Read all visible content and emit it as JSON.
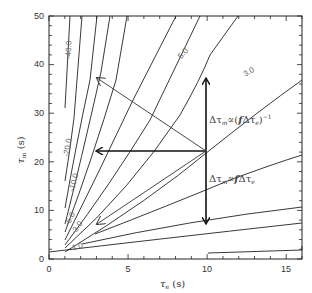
{
  "chart_data": {
    "type": "contour",
    "title": "",
    "xlabel": "τe (s)",
    "ylabel": "τm (s)",
    "xlim": [
      0,
      16
    ],
    "ylim": [
      0,
      50
    ],
    "x_ticks": [
      0,
      5,
      10,
      15
    ],
    "y_ticks": [
      0,
      10,
      20,
      30,
      40,
      50
    ],
    "grid": false,
    "contour_levels": [
      {
        "label": "-40.0",
        "points": [
          [
            1.0,
            31
          ],
          [
            1.4,
            50
          ]
        ]
      },
      {
        "label": "-20.0",
        "points": [
          [
            1.0,
            16
          ],
          [
            1.5,
            29
          ],
          [
            2.3,
            50
          ]
        ]
      },
      {
        "label": "-10.0",
        "points": [
          [
            1.0,
            10.5
          ],
          [
            2.0,
            22
          ],
          [
            3.3,
            40
          ],
          [
            4.0,
            50
          ]
        ]
      },
      {
        "label": "",
        "points": [
          [
            1.0,
            7.5
          ],
          [
            2.5,
            20
          ],
          [
            4.5,
            38
          ],
          [
            5.7,
            50
          ]
        ]
      },
      {
        "label": "-5.0",
        "points": [
          [
            1.0,
            5.5
          ],
          [
            3.0,
            19
          ],
          [
            5.5,
            36
          ],
          [
            8.0,
            50
          ]
        ]
      },
      {
        "label": "-3.0",
        "points": [
          [
            1.0,
            4.2
          ],
          [
            3.5,
            17
          ],
          [
            7.0,
            33
          ],
          [
            10.5,
            50
          ]
        ]
      },
      {
        "label": "",
        "points": [
          [
            1.0,
            3.2
          ],
          [
            4.0,
            15
          ],
          [
            8.5,
            32
          ],
          [
            13.2,
            50
          ]
        ]
      },
      {
        "label": "5.0",
        "points": [
          [
            1.0,
            2.4
          ],
          [
            5.0,
            14
          ],
          [
            10.5,
            30
          ],
          [
            16.0,
            45
          ]
        ]
      },
      {
        "label": "3.0",
        "points": [
          [
            1.0,
            1.8
          ],
          [
            6.5,
            14
          ],
          [
            12.0,
            26
          ],
          [
            16.0,
            37
          ]
        ]
      },
      {
        "label": "",
        "points": [
          [
            2.0,
            5.5
          ],
          [
            8.0,
            12
          ],
          [
            14.0,
            18
          ],
          [
            16.0,
            19.5
          ]
        ]
      },
      {
        "label": "1.0",
        "points": [
          [
            2.0,
            3.5
          ],
          [
            9.0,
            7
          ],
          [
            16.0,
            10
          ]
        ]
      },
      {
        "label": "",
        "points": [
          [
            0.0,
            1.5
          ],
          [
            6.0,
            4
          ],
          [
            16.0,
            7.5
          ]
        ]
      },
      {
        "label": "",
        "points": [
          [
            10.0,
            1
          ],
          [
            16.0,
            1.5
          ]
        ]
      }
    ],
    "annotations": [
      {
        "text": "Δτm ∝ (fΔτe)^-1",
        "x": 10.2,
        "y": 26
      },
      {
        "text": "Δτm ∝ fΔτe",
        "x": 10.2,
        "y": 16
      }
    ],
    "arrows": [
      {
        "from": [
          10,
          22
        ],
        "to": [
          10,
          38
        ],
        "style": "bold"
      },
      {
        "from": [
          10,
          22
        ],
        "to": [
          10,
          5.5
        ],
        "style": "bold"
      },
      {
        "from": [
          10,
          22
        ],
        "to": [
          3,
          22
        ],
        "style": "bold"
      },
      {
        "from": [
          10,
          22
        ],
        "to": [
          3,
          37.5
        ],
        "style": "thin"
      },
      {
        "from": [
          10,
          22
        ],
        "to": [
          3,
          7.5
        ],
        "style": "thin"
      }
    ]
  },
  "axes": {
    "x_title_main": "τ",
    "x_title_sub": "e",
    "x_title_unit": " (s)",
    "y_title_main": "τ",
    "y_title_sub": "m",
    "y_title_unit": " (s)",
    "x_tick_labels": [
      "0",
      "5",
      "10",
      "15"
    ],
    "y_tick_labels": [
      "0",
      "10",
      "20",
      "30",
      "40",
      "50"
    ]
  },
  "labels": {
    "c40": "-40.0",
    "c20": "-20.0",
    "c10": "-10.0",
    "c5neg": "-5.0",
    "c3neg": "-3.0",
    "c5": "5.0",
    "c3": "3.0",
    "c1": "1.0"
  },
  "annotations": {
    "upper_prefix": "Δτ",
    "upper_sub": "m",
    "upper_mid": "∝(",
    "upper_f": "f",
    "upper_delta": "Δτ",
    "upper_sub2": "e",
    "upper_close": ")",
    "upper_exp": "−1",
    "lower_prefix": "Δτ",
    "lower_sub": "m",
    "lower_mid": "∝",
    "lower_f": "f",
    "lower_delta": "Δτ",
    "lower_sub2": "e"
  }
}
